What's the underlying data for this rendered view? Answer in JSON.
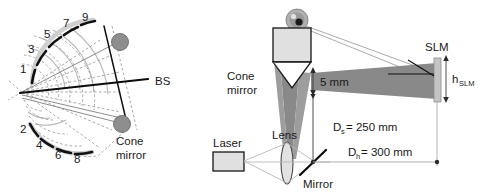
{
  "figure": {
    "panels": [
      "left-ray-diagram",
      "right-setup-schematic"
    ]
  },
  "left_panel": {
    "upper_arc_numbers": [
      "1",
      "3",
      "5",
      "7",
      "9"
    ],
    "lower_arc_numbers": [
      "2",
      "4",
      "6",
      "8"
    ],
    "beamsplitter_label": "BS",
    "cone_mirror_label_line1": "Cone",
    "cone_mirror_label_line2": "mirror"
  },
  "right_panel": {
    "cone_mirror_label_line1": "Cone",
    "cone_mirror_label_line2": "mirror",
    "laser_label": "Laser",
    "lens_label": "Lens",
    "mirror_label": "Mirror",
    "slm_label": "SLM",
    "slm_height_symbol": "h",
    "slm_height_subscript": "SLM",
    "beam_thickness": "5 mm",
    "distance_s": {
      "symbol": "D",
      "subscript": "s",
      "value": "= 250 mm"
    },
    "distance_h": {
      "symbol": "D",
      "subscript": "h",
      "value": "= 300 mm"
    }
  },
  "colors": {
    "beam_dark": "#898989",
    "beam_mid": "#9d9d9d",
    "beam_light": "#d9d9d9",
    "component_fill": "#e0e0e0",
    "stroke_black": "#111111",
    "gray_circle": "#8e8e8e"
  }
}
